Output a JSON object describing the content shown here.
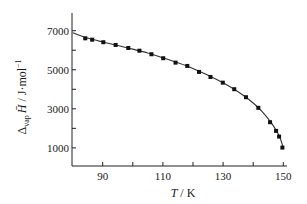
{
  "chart_data": {
    "type": "scatter",
    "title": "",
    "xlabel": "T / K",
    "xlabel_parts": {
      "var": "T",
      "unit": " / K"
    },
    "ylabel": "Δvap H̄ / J·mol⁻¹",
    "ylabel_parts": {
      "delta": "Δ",
      "sub": "vap",
      "var": "H̄",
      "unit": " / J·mol",
      "exp": "−1"
    },
    "xlim": [
      80,
      152
    ],
    "ylim": [
      0,
      8000
    ],
    "x_ticks": [
      90,
      100,
      110,
      120,
      130,
      140,
      150
    ],
    "x_tick_labels": [
      "90",
      "",
      "110",
      "",
      "130",
      "",
      "150"
    ],
    "y_ticks": [
      1000,
      2000,
      3000,
      4000,
      5000,
      6000,
      7000
    ],
    "y_tick_labels": [
      "1000",
      "",
      "3000",
      "",
      "5000",
      "",
      "7000"
    ],
    "grid": false,
    "legend": null,
    "series": [
      {
        "name": "measured",
        "style": "markers",
        "x": [
          84.2,
          86.5,
          90.2,
          94.3,
          98.5,
          102.2,
          106.2,
          110.1,
          114.2,
          118.1,
          122.0,
          125.8,
          129.9,
          133.7,
          137.6,
          141.7,
          145.6,
          147.6,
          148.6,
          149.7
        ],
        "y": [
          6610,
          6540,
          6410,
          6270,
          6115,
          5975,
          5795,
          5590,
          5365,
          5195,
          4890,
          4630,
          4340,
          4005,
          3595,
          3050,
          2315,
          1870,
          1580,
          1015
        ]
      },
      {
        "name": "fit",
        "style": "line",
        "x": [
          80,
          85,
          90,
          95,
          100,
          105,
          110,
          115,
          120,
          125,
          130,
          135,
          140,
          143,
          146,
          148,
          149,
          150
        ],
        "y": [
          6900,
          6620,
          6420,
          6240,
          6060,
          5860,
          5610,
          5360,
          5070,
          4720,
          4330,
          3870,
          3300,
          2850,
          2280,
          1800,
          1480,
          1000
        ]
      }
    ]
  },
  "labels": {
    "x_axis_var": "T",
    "x_axis_unit": " / K",
    "y_axis_delta": "Δ",
    "y_axis_sub": "vap",
    "y_axis_var": "H̄",
    "y_axis_unit": " / J·mol",
    "y_axis_exp": "−1"
  }
}
